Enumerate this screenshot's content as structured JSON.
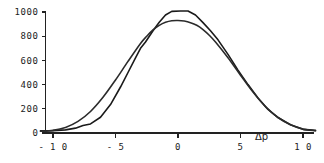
{
  "chart_data": {
    "type": "line",
    "title": "",
    "subtitle": "",
    "xlabel": "Δp",
    "ylabel": "",
    "xlim": [
      -11.2,
      11.0
    ],
    "ylim": [
      0,
      1060
    ],
    "grid": false,
    "legend": "none",
    "axis_color": "#222222",
    "xticks": [
      -10,
      -5,
      0,
      5,
      10
    ],
    "xtick_labels": [
      "- 1 0",
      "- 5",
      "0",
      "5",
      "1 0"
    ],
    "yticks": [
      0,
      200,
      400,
      600,
      800,
      1000
    ],
    "ytick_labels": [
      "0",
      "200",
      "400",
      "600",
      "800",
      "1000"
    ],
    "series": [
      {
        "name": "measured-distribution",
        "style": "piecewise-linear",
        "color": "#1a1a1a",
        "width": 1.6,
        "x": [
          -11.0,
          -10.0,
          -9.0,
          -8.2,
          -7.6,
          -7.0,
          -6.2,
          -5.4,
          -4.6,
          -4.0,
          -3.4,
          -3.0,
          -2.6,
          -2.0,
          -1.5,
          -1.0,
          -0.5,
          0.2,
          0.8,
          1.4,
          2.0,
          2.6,
          3.2,
          4.0,
          4.8,
          5.6,
          6.4,
          7.2,
          8.0,
          9.0,
          10.0,
          11.0
        ],
        "y": [
          18,
          20,
          26,
          40,
          62,
          75,
          130,
          235,
          380,
          500,
          620,
          700,
          752,
          845,
          915,
          975,
          1005,
          1008,
          1008,
          975,
          912,
          845,
          770,
          650,
          520,
          400,
          290,
          195,
          128,
          68,
          30,
          22
        ]
      },
      {
        "name": "fitted-gaussian",
        "style": "smooth",
        "color": "#2b2b2b",
        "width": 1.6,
        "x": [
          -11.0,
          -10.0,
          -9.0,
          -8.0,
          -7.0,
          -6.0,
          -5.0,
          -4.0,
          -3.0,
          -2.5,
          -2.0,
          -1.5,
          -1.0,
          -0.5,
          0.0,
          0.5,
          1.0,
          1.5,
          2.0,
          2.5,
          3.0,
          4.0,
          5.0,
          6.0,
          7.0,
          8.0,
          9.0,
          10.0,
          11.0
        ],
        "y": [
          14,
          22,
          46,
          96,
          178,
          295,
          438,
          592,
          740,
          800,
          852,
          890,
          915,
          928,
          930,
          925,
          912,
          890,
          855,
          808,
          752,
          622,
          478,
          338,
          218,
          128,
          68,
          32,
          18
        ]
      }
    ]
  },
  "figure": {
    "background_color": "#ffffff",
    "axis_label": "Δp"
  }
}
